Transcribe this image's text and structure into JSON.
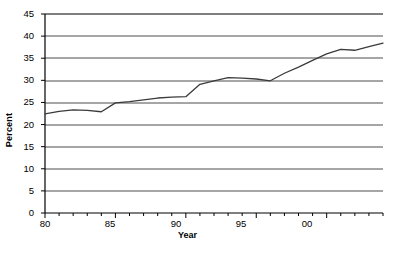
{
  "chart_data": {
    "type": "line",
    "title": "",
    "xlabel": "Year",
    "ylabel": "Percent",
    "xlim": [
      80,
      104
    ],
    "ylim": [
      0,
      45
    ],
    "ytick_step": 5,
    "grid": true,
    "grid_axis": "y",
    "legend": null,
    "line_color": "#3b3b3b",
    "x": [
      80,
      81,
      82,
      83,
      84,
      85,
      86,
      87,
      88,
      89,
      90,
      91,
      92,
      93,
      94,
      95,
      96,
      97,
      98,
      99,
      100,
      101,
      102,
      103,
      104
    ],
    "xtick_labels_major": [
      "80",
      "85",
      "90",
      "95",
      "00"
    ],
    "xtick_values_major": [
      80,
      85,
      90,
      95,
      100
    ],
    "ytick_labels": [
      "0",
      "5",
      "10",
      "15",
      "20",
      "25",
      "30",
      "35",
      "40",
      "45"
    ],
    "ytick_values": [
      0,
      5,
      10,
      15,
      20,
      25,
      30,
      35,
      40,
      45
    ],
    "values": [
      22.4,
      23.0,
      23.3,
      23.2,
      22.9,
      24.9,
      25.2,
      25.6,
      26.0,
      26.2,
      26.3,
      29.1,
      29.9,
      30.6,
      30.5,
      30.3,
      29.9,
      31.6,
      33.0,
      34.5,
      36.0,
      37.0,
      36.8,
      37.6,
      38.4
    ]
  },
  "axes": {
    "ylabel_text": "Percent",
    "xlabel_text": "Year"
  }
}
